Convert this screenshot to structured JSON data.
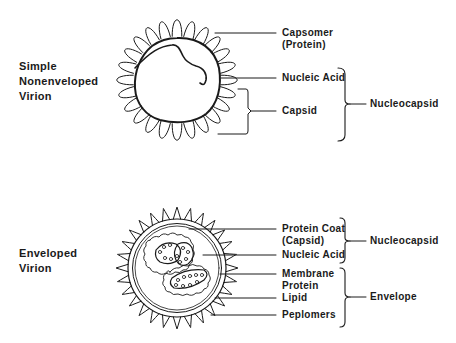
{
  "simple_virion": {
    "title_lines": [
      "Simple",
      "Nonenveloped",
      "Virion"
    ],
    "labels": {
      "capsomer": [
        "Capsomer",
        "(Protein)"
      ],
      "nucleic_acid": "Nucleic Acid",
      "capsid": "Capsid"
    },
    "group_label": "Nucleocapsid"
  },
  "enveloped_virion": {
    "title_lines": [
      "Enveloped",
      "Virion"
    ],
    "labels": {
      "protein_coat": [
        "Protein Coat",
        "(Capsid)"
      ],
      "nucleic_acid": "Nucleic Acid",
      "membrane_protein": [
        "Membrane",
        "Protein"
      ],
      "lipid": "Lipid",
      "peplomers": "Peplomers"
    },
    "group_labels": {
      "nucleocapsid": "Nucleocapsid",
      "envelope": "Envelope"
    }
  },
  "colors": {
    "ink": "#1a1a1a",
    "background": "#ffffff"
  }
}
